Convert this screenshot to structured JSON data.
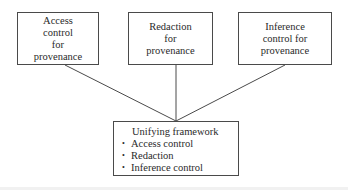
{
  "diagram": {
    "top_boxes": [
      {
        "id": "access",
        "label": "Access\ncontrol\nfor\nprovenance"
      },
      {
        "id": "redaction",
        "label": "Redaction\nfor\nprovenance"
      },
      {
        "id": "inference",
        "label": "Inference\ncontrol for\nprovenance"
      }
    ],
    "bottom_box": {
      "title": "Unifying framework",
      "items": [
        "Access control",
        "Redaction",
        "Inference control"
      ]
    },
    "bullet_glyph": "•",
    "colors": {
      "stroke": "#4a4a4a",
      "text": "#2a2a2a",
      "background": "#ffffff"
    }
  }
}
